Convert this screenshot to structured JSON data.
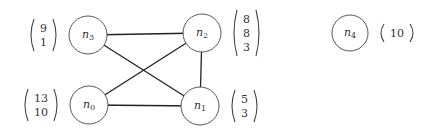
{
  "diagram": {
    "type": "graph",
    "nodes": [
      {
        "id": "n0",
        "name": "n",
        "sub": "0",
        "x": 89,
        "y": 105,
        "r": 19,
        "vector": [
          "13",
          "10"
        ],
        "vector_side": "left"
      },
      {
        "id": "n1",
        "name": "n",
        "sub": "1",
        "x": 200,
        "y": 106,
        "r": 19,
        "vector": [
          "5",
          "3"
        ],
        "vector_side": "right"
      },
      {
        "id": "n2",
        "name": "n",
        "sub": "2",
        "x": 202,
        "y": 33,
        "r": 19,
        "vector": [
          "8",
          "8",
          "3"
        ],
        "vector_side": "right"
      },
      {
        "id": "n3",
        "name": "n",
        "sub": "3",
        "x": 88,
        "y": 35,
        "r": 19,
        "vector": [
          "9",
          "1"
        ],
        "vector_side": "left"
      },
      {
        "id": "n4",
        "name": "n",
        "sub": "4",
        "x": 350,
        "y": 33,
        "r": 18,
        "vector": [
          "10"
        ],
        "vector_side": "right"
      }
    ],
    "edges": [
      {
        "from": "n3",
        "to": "n2"
      },
      {
        "from": "n3",
        "to": "n1"
      },
      {
        "from": "n2",
        "to": "n0"
      },
      {
        "from": "n2",
        "to": "n1"
      },
      {
        "from": "n0",
        "to": "n1"
      }
    ]
  }
}
